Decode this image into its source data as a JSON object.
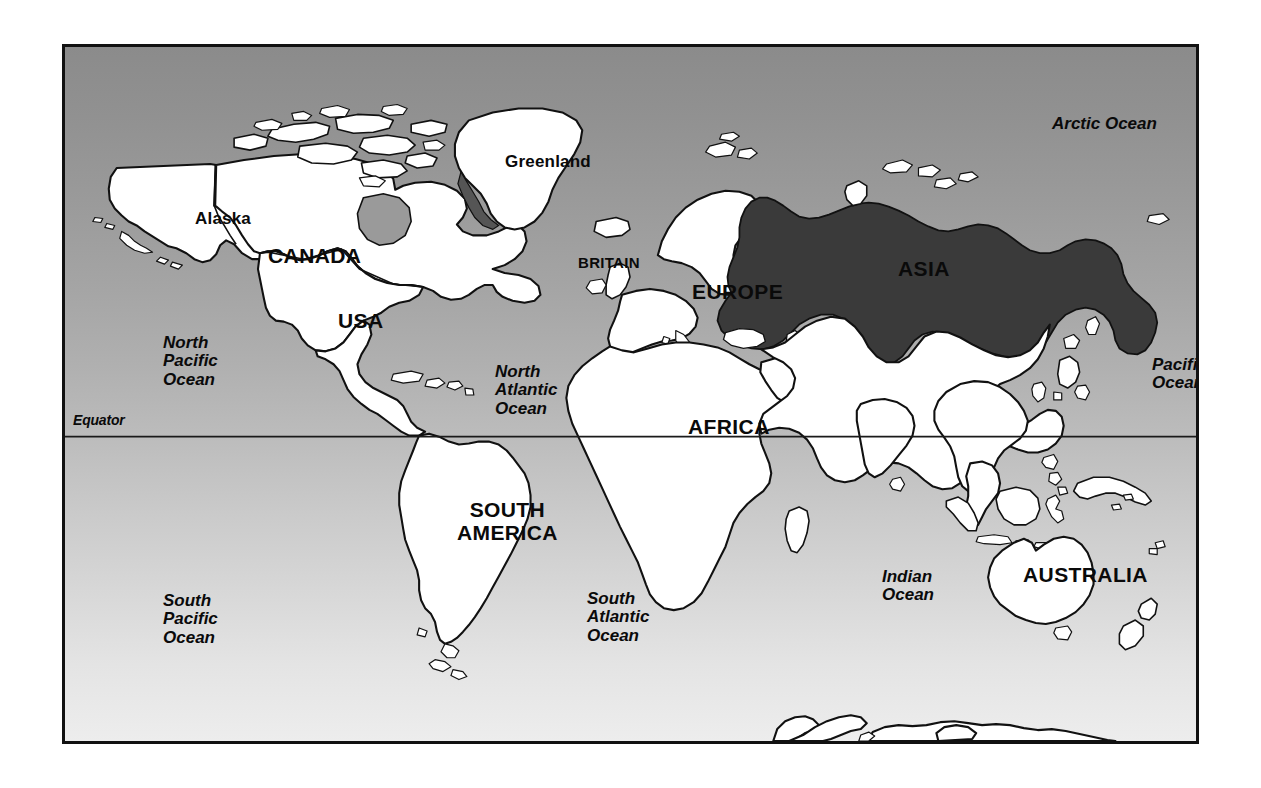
{
  "figure": {
    "kind": "world-map",
    "title_on_image": "",
    "frame": {
      "x": 62,
      "y": 44,
      "width": 1137,
      "height": 700,
      "border_color": "#111111",
      "border_width_px": 3
    },
    "background": {
      "type": "vertical-gradient",
      "top_color": "#8b8b8b",
      "bottom_color": "#ededed",
      "note": "ocean fill, dark gray at top fading to near-white at bottom"
    },
    "land": {
      "fill": "#ffffff",
      "stroke": "#111111"
    },
    "shaded_region": {
      "fill": "#3a3a3a",
      "stroke": "#111111",
      "name": "shaded-territory"
    }
  },
  "graticule": {
    "equator": {
      "label": "Equator",
      "label_x": 70,
      "label_y": 418,
      "line_y": 437,
      "stroke": "#1a1a1a"
    }
  },
  "labels": {
    "continents": [
      {
        "id": "canada",
        "text": "CANADA",
        "x": 203,
        "y": 210,
        "style": "continent",
        "align": "left"
      },
      {
        "id": "usa",
        "text": "USA",
        "x": 273,
        "y": 274,
        "style": "continent",
        "align": "left"
      },
      {
        "id": "south-america",
        "text": "SOUTH\nAMERICA",
        "x": 392,
        "y": 462,
        "style": "continent",
        "align": "center"
      },
      {
        "id": "africa",
        "text": "AFRICA",
        "x": 623,
        "y": 380,
        "style": "continent",
        "align": "left"
      },
      {
        "id": "europe",
        "text": "EUROPE",
        "x": 627,
        "y": 246,
        "style": "continent",
        "align": "left"
      },
      {
        "id": "asia",
        "text": "ASIA",
        "x": 833,
        "y": 222,
        "style": "continent",
        "align": "left"
      },
      {
        "id": "australia",
        "text": "AUSTRALIA",
        "x": 958,
        "y": 528,
        "style": "continent",
        "align": "left"
      }
    ],
    "regions": [
      {
        "id": "alaska",
        "text": "Alaska",
        "x": 130,
        "y": 172,
        "style": "region"
      },
      {
        "id": "greenland",
        "text": "Greenland",
        "x": 440,
        "y": 115,
        "style": "region"
      },
      {
        "id": "britain",
        "text": "BRITAIN",
        "x": 513,
        "y": 216,
        "style": "small-caps"
      }
    ],
    "oceans": [
      {
        "id": "arctic-ocean",
        "text": "Arctic Ocean",
        "x": 987,
        "y": 78,
        "style": "ocean"
      },
      {
        "id": "north-pacific-ocean",
        "text": "North\nPacific\nOcean",
        "x": 98,
        "y": 297,
        "style": "ocean"
      },
      {
        "id": "north-atlantic-ocean",
        "text": "North\nAtlantic\nOcean",
        "x": 430,
        "y": 326,
        "style": "ocean"
      },
      {
        "id": "pacific-ocean",
        "text": "Pacific\nOcean",
        "x": 1087,
        "y": 319,
        "style": "ocean"
      },
      {
        "id": "south-pacific-ocean",
        "text": "South\nPacific\nOcean",
        "x": 98,
        "y": 555,
        "style": "ocean"
      },
      {
        "id": "south-atlantic-ocean",
        "text": "South\nAtlantic\nOcean",
        "x": 522,
        "y": 553,
        "style": "ocean"
      },
      {
        "id": "indian-ocean",
        "text": "Indian\nOcean",
        "x": 817,
        "y": 531,
        "style": "ocean"
      }
    ]
  },
  "map_data": {
    "projection": "equirectangular-like",
    "landmasses_depicted": [
      "Alaska",
      "Canada",
      "USA",
      "Greenland",
      "Mexico",
      "Central America",
      "Caribbean islands",
      "South America",
      "Britain",
      "Ireland",
      "Iceland",
      "Scandinavia",
      "Europe",
      "Africa",
      "Madagascar",
      "Arabia",
      "Asia",
      "India",
      "Sri Lanka",
      "Japan",
      "Philippines",
      "Indonesia",
      "Borneo",
      "New Guinea",
      "Australia",
      "New Zealand",
      "Antarctica",
      "Canadian Arctic Archipelago",
      "Novaya Zemlya",
      "Svalbard",
      "Sakhalin"
    ],
    "shaded_territory_note": "A single contiguous dark-shaded territory covering eastern Europe and northern Asia, bounded on the north by the Arctic coast, reaching west past the Baltic and Black Sea and east to the Pacific coast.",
    "borders_drawn": [
      "Alaska-Canada",
      "Canada-USA"
    ]
  }
}
